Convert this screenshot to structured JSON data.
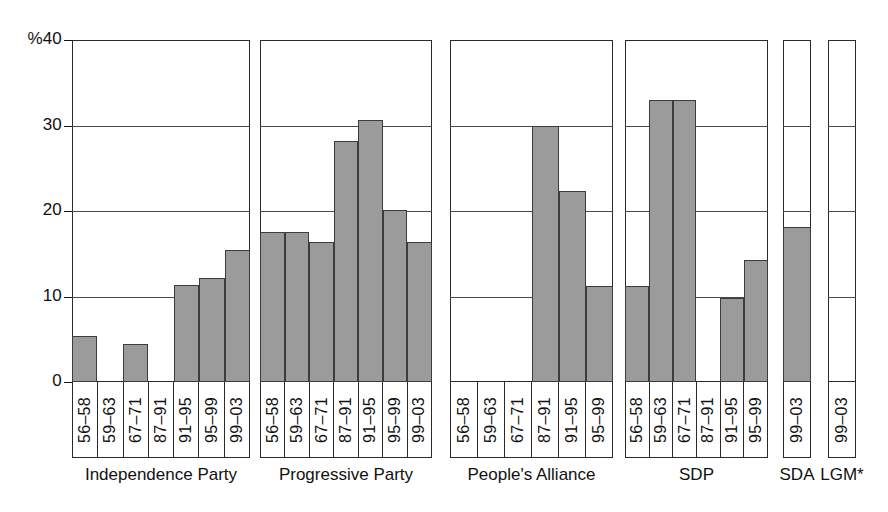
{
  "chart_data": {
    "type": "bar",
    "title": "",
    "xlabel": "",
    "ylabel": "%",
    "ylim": [
      0,
      40
    ],
    "yticks": [
      0,
      10,
      20,
      30,
      40
    ],
    "ytick_labels": [
      "0",
      "10",
      "20",
      "30",
      "%40"
    ],
    "grid": true,
    "legend": false,
    "unit": "%",
    "note": "LGM* panel has no bar (0 for 99–03)",
    "groups": [
      {
        "name": "Independence Party",
        "categories": [
          "56–58",
          "59–63",
          "67–71",
          "87–91",
          "91–95",
          "95–99",
          "99–03"
        ],
        "values": [
          5.4,
          0,
          4.5,
          0,
          11.4,
          12.2,
          15.4
        ]
      },
      {
        "name": "Progressive Party",
        "categories": [
          "56–58",
          "59–63",
          "67–71",
          "87–91",
          "91–95",
          "95–99",
          "99–03"
        ],
        "values": [
          17.5,
          17.5,
          16.4,
          28.2,
          30.6,
          20.1,
          16.4
        ]
      },
      {
        "name": "People's Alliance",
        "categories": [
          "56–58",
          "59–63",
          "67–71",
          "87–91",
          "91–95",
          "95–99"
        ],
        "values": [
          0,
          0,
          0,
          30.0,
          22.3,
          11.2
        ]
      },
      {
        "name": "SDP",
        "categories": [
          "56–58",
          "59–63",
          "67–71",
          "87–91",
          "91–95",
          "95–99"
        ],
        "values": [
          11.2,
          33.0,
          33.0,
          0,
          9.8,
          14.3
        ]
      },
      {
        "name": "SDA",
        "categories": [
          "99–03"
        ],
        "values": [
          18.1
        ]
      },
      {
        "name": "LGM*",
        "categories": [
          "99–03"
        ],
        "values": [
          0
        ]
      }
    ],
    "colors": {
      "bar_fill": "#9b9b9b",
      "bar_stroke": "#3c3c3c",
      "axis": "#111111",
      "grid": "#4a4a4a",
      "background": "#ffffff"
    }
  }
}
